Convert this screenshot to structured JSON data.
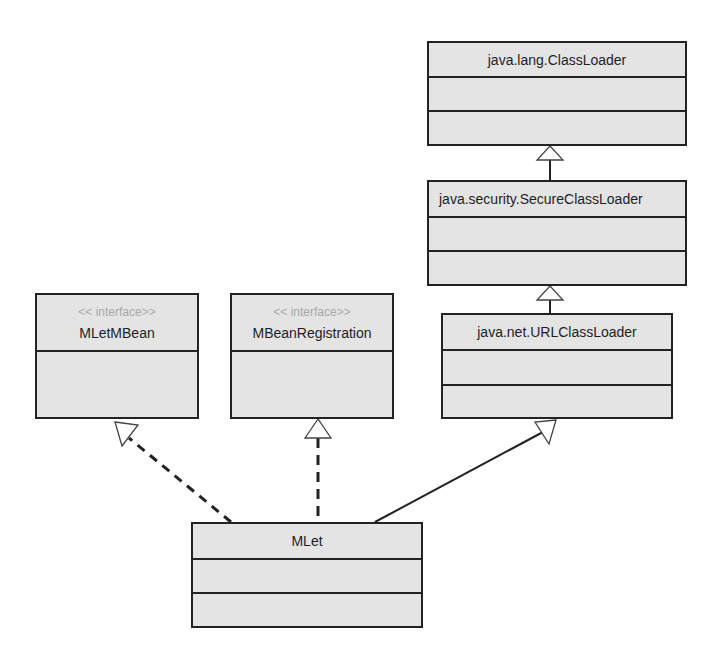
{
  "diagram": {
    "type": "uml-class-diagram",
    "classes": {
      "classloader": {
        "name": "java.lang.ClassLoader"
      },
      "secureclassloader": {
        "name": "java.security.SecureClassLoader"
      },
      "urlclassloader": {
        "name": "java.net.URLClassLoader"
      },
      "mletmbean": {
        "stereotype": "<< interface>>",
        "name": "MLetMBean"
      },
      "mbeanregistration": {
        "stereotype": "<< interface>>",
        "name": "MBeanRegistration"
      },
      "mlet": {
        "name": "MLet"
      }
    },
    "relationships": [
      {
        "from": "java.security.SecureClassLoader",
        "to": "java.lang.ClassLoader",
        "kind": "generalization",
        "line": "solid"
      },
      {
        "from": "java.net.URLClassLoader",
        "to": "java.security.SecureClassLoader",
        "kind": "generalization",
        "line": "solid"
      },
      {
        "from": "MLet",
        "to": "java.net.URLClassLoader",
        "kind": "generalization",
        "line": "solid"
      },
      {
        "from": "MLet",
        "to": "MLetMBean",
        "kind": "realization",
        "line": "dashed"
      },
      {
        "from": "MLet",
        "to": "MBeanRegistration",
        "kind": "realization",
        "line": "dashed"
      }
    ],
    "colors": {
      "box_fill": "#e4e4e4",
      "box_border": "#222222",
      "stereotype_text": "#a8a8a8",
      "text": "#1e1e1e",
      "background": "#ffffff"
    }
  }
}
